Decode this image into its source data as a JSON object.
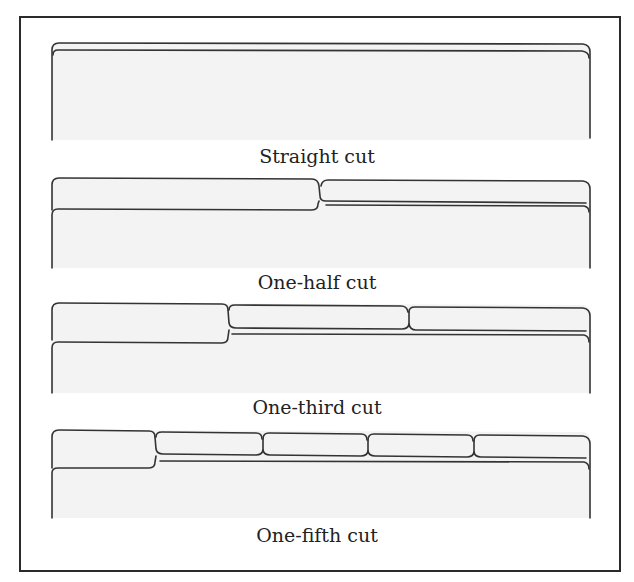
{
  "figure": {
    "frame_color": "#2b2b2b",
    "line_color": "#333333",
    "fill_color": "#f3f3f3"
  },
  "folders": [
    {
      "label": "Straight cut",
      "tabs": 1,
      "label_top": 145
    },
    {
      "label": "One-half cut",
      "tabs": 2,
      "label_top": 271
    },
    {
      "label": "One-third cut",
      "tabs": 3,
      "label_top": 396
    },
    {
      "label": "One-fifth cut",
      "tabs": 5,
      "label_top": 524
    }
  ]
}
